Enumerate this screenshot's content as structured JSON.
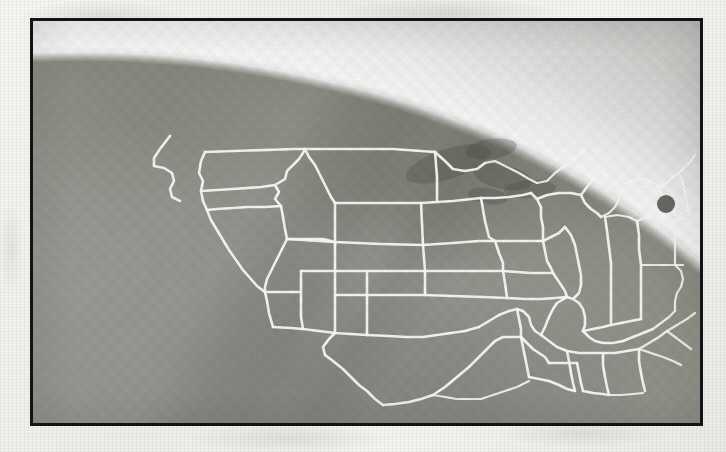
{
  "document": {
    "medium": "printed halftone photograph on paper",
    "kind": "photograph"
  },
  "photograph": {
    "subject": "Earth viewed from space with United States state boundaries overlaid",
    "orientation": "landscape",
    "frame_border_color": "#131313",
    "paper_color": "#f2f1ee"
  },
  "scene": {
    "earth_surface_color": "#97968f",
    "space_background_color": "#b5b4b1",
    "limb_glow_color": "#ffffff",
    "boundary_line_color": "#fdfdfb",
    "dark_spot_color": "#5d5d58",
    "features": [
      {
        "name": "earth-limb",
        "label": "Earth limb (horizon arc)"
      },
      {
        "name": "atmospheric-glow",
        "label": "Atmospheric glow band"
      },
      {
        "name": "space-background",
        "label": "Space beyond the limb"
      },
      {
        "name": "state-boundaries",
        "label": "United States state boundaries"
      },
      {
        "name": "great-lakes",
        "label": "Great Lakes"
      },
      {
        "name": "gulf-of-mexico",
        "label": "Gulf of Mexico"
      },
      {
        "name": "pacific-ocean",
        "label": "Pacific Ocean"
      },
      {
        "name": "baja-california",
        "label": "Baja California peninsula"
      },
      {
        "name": "alaska-panhandle",
        "label": "Alaska panhandle / Canadian coast"
      },
      {
        "name": "dark-spot-northeast",
        "label": "Dark spot over the Northeast"
      }
    ]
  },
  "map": {
    "region": "Contiguous United States",
    "projection": "orthographic globe view",
    "states": [
      "Washington",
      "Oregon",
      "California",
      "Nevada",
      "Idaho",
      "Montana",
      "Wyoming",
      "Utah",
      "Arizona",
      "Colorado",
      "New Mexico",
      "North Dakota",
      "South Dakota",
      "Nebraska",
      "Kansas",
      "Oklahoma",
      "Texas",
      "Minnesota",
      "Iowa",
      "Missouri",
      "Arkansas",
      "Louisiana",
      "Wisconsin",
      "Illinois",
      "Michigan",
      "Indiana",
      "Ohio",
      "Kentucky",
      "Tennessee",
      "Mississippi",
      "Alabama",
      "Georgia",
      "Florida",
      "South Carolina",
      "North Carolina",
      "Virginia",
      "West Virginia",
      "Pennsylvania",
      "New York",
      "Maine",
      "Vermont",
      "New Hampshire",
      "Massachusetts",
      "Rhode Island",
      "Connecticut",
      "New Jersey",
      "Delaware",
      "Maryland"
    ]
  }
}
